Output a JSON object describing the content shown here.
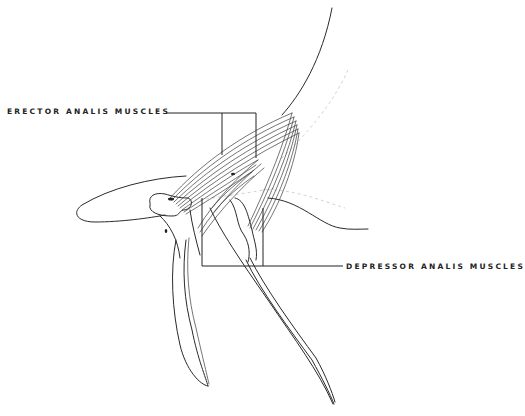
{
  "figure": {
    "labels": {
      "erector": "ERECTOR ANALIS MUSCLES",
      "depressor": "DEPRESSOR ANALIS MUSCLES"
    },
    "colors": {
      "ink": "#2a2a2a",
      "background": "#ffffff",
      "faint_outline": "#c8c8c8"
    }
  }
}
